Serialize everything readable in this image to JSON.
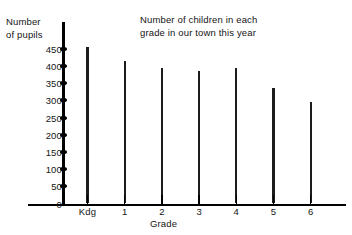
{
  "chart_data": {
    "type": "bar",
    "title": "Number of children in each\ngrade in our town this year",
    "xlabel": "Grade",
    "ylabel": "Number\nof pupils",
    "categories": [
      "Kdg",
      "1",
      "2",
      "3",
      "4",
      "5",
      "6"
    ],
    "values": [
      455,
      415,
      395,
      385,
      395,
      335,
      295
    ],
    "ylim": [
      0,
      460
    ],
    "yticks": [
      0,
      50,
      100,
      150,
      200,
      250,
      300,
      350,
      400,
      450
    ],
    "ytick_labels": [
      "0",
      "50",
      "100",
      "150",
      "200",
      "250",
      "300",
      "350",
      "400",
      "450"
    ],
    "grid": false,
    "legend": null,
    "bar_color": "#1c1c1c",
    "axis_color": "#000000",
    "background_color": "#ffffff"
  }
}
